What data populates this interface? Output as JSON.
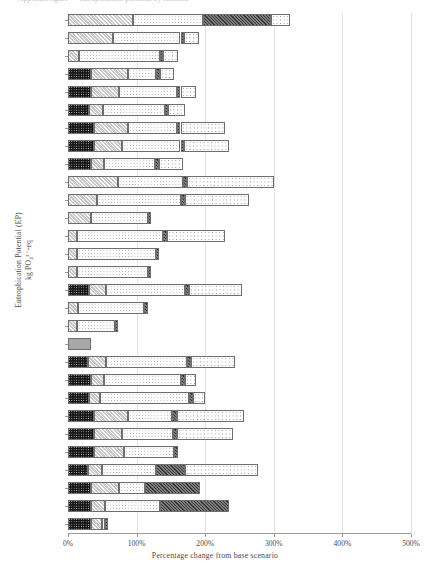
{
  "top_title_clipped": "Appendix figure — eutrophication potential by scenario",
  "axes": {
    "ylabel_line1": "Eutrophication Potential (EP)",
    "ylabel_line2": "kg PO₄³⁻-eq",
    "xlabel": "Percentage change from base scenario",
    "xticks": [
      "0%",
      "100%",
      "200%",
      "300%",
      "400%",
      "500%"
    ],
    "xtick_values": [
      0,
      100,
      200,
      300,
      400,
      500
    ],
    "xlim": [
      0,
      500
    ]
  },
  "colors": {
    "segment_1": "#151515",
    "segment_2": "#c9c9c9",
    "segment_3": "#fbfbfb",
    "segment_4": "#7e7e7e",
    "segment_5": "#ffffff",
    "single_bar": "#a8a8a8",
    "grid": "#e2e2e2",
    "axis": "#9a9a9a"
  },
  "chart_data": {
    "type": "bar",
    "orientation": "horizontal",
    "stacked": true,
    "title": "",
    "xlabel": "Percentage change from base scenario",
    "ylabel": "Eutrophication Potential (EP) kg PO4---eq",
    "xlim": [
      0,
      500
    ],
    "grid": true,
    "legend": "none",
    "categories": [
      "5,257",
      "4,616",
      "3,979",
      "3,761",
      "3,462",
      "2,984",
      "2,626",
      "2,308",
      "1,990",
      "1,383",
      "1,230",
      "1,144",
      "1,077",
      "1,028",
      "980",
      "944",
      "938",
      "896",
      "854",
      "808",
      "765",
      "704",
      "660",
      "615",
      "572",
      "540",
      "512",
      "471",
      "427"
    ],
    "series": [
      {
        "name": "segment-1",
        "pattern": "black-dot",
        "values": [
          0,
          0,
          0,
          33,
          33,
          31,
          38,
          38,
          33,
          0,
          0,
          0,
          0,
          0,
          0,
          30,
          0,
          0,
          0,
          29,
          33,
          30,
          38,
          38,
          38,
          29,
          33,
          33,
          33
        ]
      },
      {
        "name": "segment-2",
        "pattern": "grey-hatch",
        "values": [
          95,
          66,
          16,
          54,
          41,
          20,
          49,
          41,
          20,
          73,
          42,
          34,
          13,
          13,
          13,
          26,
          15,
          13,
          0,
          27,
          20,
          17,
          49,
          40,
          44,
          20,
          41,
          21,
          16
        ]
      },
      {
        "name": "segment-3",
        "pattern": "white-dot",
        "values": [
          102,
          98,
          118,
          42,
          85,
          90,
          72,
          85,
          74,
          95,
          123,
          82,
          126,
          115,
          103,
          115,
          96,
          55,
          0,
          118,
          112,
          130,
          65,
          75,
          73,
          80,
          38,
          80,
          5
        ]
      },
      {
        "name": "segment-4",
        "pattern": "dark-hatch",
        "values": [
          99,
          5,
          5,
          5,
          5,
          5,
          5,
          5,
          5,
          5,
          5,
          5,
          5,
          5,
          5,
          5,
          5,
          5,
          0,
          5,
          5,
          5,
          7,
          6,
          5,
          41,
          81,
          100,
          5
        ]
      },
      {
        "name": "segment-5",
        "pattern": "check",
        "values": [
          28,
          22,
          21,
          21,
          23,
          24,
          65,
          66,
          35,
          128,
          94,
          0,
          85,
          0,
          0,
          77,
          0,
          0,
          0,
          65,
          17,
          17,
          98,
          82,
          0,
          107,
          0,
          0,
          0
        ]
      },
      {
        "name": "single",
        "pattern": "solid-grey",
        "values": [
          0,
          0,
          0,
          0,
          0,
          0,
          0,
          0,
          0,
          0,
          0,
          0,
          0,
          0,
          0,
          0,
          0,
          0,
          34,
          0,
          0,
          0,
          0,
          0,
          0,
          0,
          0,
          0,
          0
        ]
      }
    ],
    "totals": [
      324,
      191,
      160,
      155,
      187,
      170,
      229,
      235,
      167,
      301,
      264,
      121,
      229,
      133,
      121,
      253,
      116,
      73,
      34,
      244,
      187,
      199,
      257,
      241,
      160,
      277,
      193,
      234,
      59
    ]
  }
}
